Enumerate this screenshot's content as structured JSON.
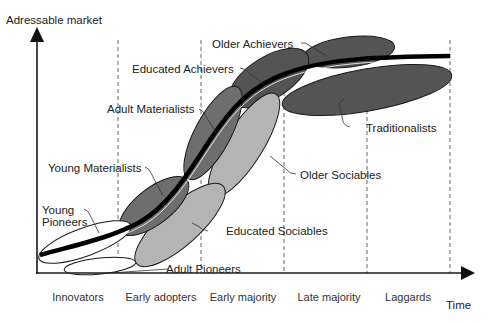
{
  "diagram": {
    "y_axis_label": "Adressable market",
    "x_axis_label": "Time",
    "phases": [
      "Innovators",
      "Early adopters",
      "Early majority",
      "Late majority",
      "Laggards"
    ],
    "segments": [
      {
        "name": "Young Pioneers",
        "label_line1": "Young",
        "label_line2": "Pioneers",
        "fill": "#ffffff"
      },
      {
        "name": "Adult Pioneers",
        "label": "Adult Pioneers",
        "fill": "#ffffff"
      },
      {
        "name": "Young Materialists",
        "label": "Young Materialists",
        "fill": "#6e6e6e"
      },
      {
        "name": "Adult Materialists",
        "label": "Adult Materialists",
        "fill": "#6e6e6e"
      },
      {
        "name": "Educated Sociables",
        "label": "Educated Sociables",
        "fill": "#b4b4b4"
      },
      {
        "name": "Older Sociables",
        "label": "Older Sociables",
        "fill": "#b4b4b4"
      },
      {
        "name": "Educated Achievers",
        "label": "Educated Achievers",
        "fill": "#545454"
      },
      {
        "name": "Older Achievers",
        "label": "Older Achievers",
        "fill": "#545454"
      },
      {
        "name": "Traditionalists",
        "label": "Traditionalists",
        "fill": "#545454"
      }
    ],
    "colors": {
      "curve": "#000000",
      "axis": "#1a1a1a",
      "dark_segment": "#545454",
      "mid_segment": "#6e6e6e",
      "light_segment": "#b4b4b4",
      "white_segment": "#ffffff"
    }
  }
}
